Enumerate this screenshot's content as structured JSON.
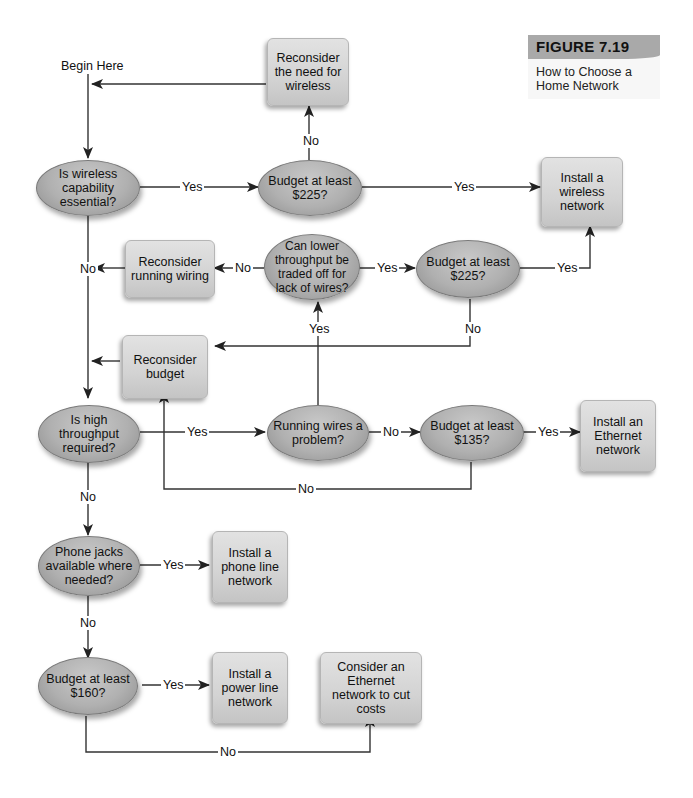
{
  "figure": {
    "label": "FIGURE 7.19",
    "caption": "How to Choose a Home Network"
  },
  "start_label": "Begin Here",
  "nodes": {
    "q_wireless": {
      "shape": "ellipse",
      "text": "Is wireless capability essential?"
    },
    "q_budget225_a": {
      "shape": "ellipse",
      "text": "Budget at least $225?"
    },
    "r_need_wireless": {
      "shape": "box",
      "text": "Reconsider the need for wireless"
    },
    "install_wireless": {
      "shape": "box",
      "text": "Install a wireless network"
    },
    "r_running_wiring": {
      "shape": "box",
      "text": "Reconsider running wiring"
    },
    "q_tradeoff": {
      "shape": "ellipse",
      "text": "Can lower throughput be traded off for lack of wires?"
    },
    "q_budget225_b": {
      "shape": "ellipse",
      "text": "Budget at least $225?"
    },
    "r_budget": {
      "shape": "box",
      "text": "Reconsider budget"
    },
    "q_throughput": {
      "shape": "ellipse",
      "text": "Is high throughput required?"
    },
    "q_wires_problem": {
      "shape": "ellipse",
      "text": "Running wires a problem?"
    },
    "q_budget135": {
      "shape": "ellipse",
      "text": "Budget at least $135?"
    },
    "install_ethernet": {
      "shape": "box",
      "text": "Install an Ethernet network"
    },
    "q_phone_jacks": {
      "shape": "ellipse",
      "text": "Phone jacks available where needed?"
    },
    "install_phone": {
      "shape": "box",
      "text": "Install a phone line network"
    },
    "q_budget160": {
      "shape": "ellipse",
      "text": "Budget at least $160?"
    },
    "install_power": {
      "shape": "box",
      "text": "Install a power line network"
    },
    "consider_ethernet": {
      "shape": "box",
      "text": "Consider an Ethernet network to cut costs"
    }
  },
  "edges": [
    {
      "from": "start",
      "to": "q_wireless",
      "label": ""
    },
    {
      "from": "q_wireless",
      "to": "q_budget225_a",
      "label": "Yes"
    },
    {
      "from": "q_budget225_a",
      "to": "r_need_wireless",
      "label": "No"
    },
    {
      "from": "r_need_wireless",
      "to": "start",
      "label": ""
    },
    {
      "from": "q_budget225_a",
      "to": "install_wireless",
      "label": "Yes"
    },
    {
      "from": "q_wireless",
      "to": "q_throughput",
      "label": "No"
    },
    {
      "from": "q_tradeoff",
      "to": "r_running_wiring",
      "label": "No"
    },
    {
      "from": "r_running_wiring",
      "to": "q_wireless_no_path",
      "label": ""
    },
    {
      "from": "q_tradeoff",
      "to": "q_budget225_b",
      "label": "Yes"
    },
    {
      "from": "q_budget225_b",
      "to": "install_wireless",
      "label": "Yes"
    },
    {
      "from": "q_budget225_b",
      "to": "r_budget",
      "label": "No"
    },
    {
      "from": "r_budget",
      "to": "q_wireless_no_path",
      "label": ""
    },
    {
      "from": "q_throughput",
      "to": "q_wires_problem",
      "label": "Yes"
    },
    {
      "from": "q_wires_problem",
      "to": "q_tradeoff",
      "label": "Yes"
    },
    {
      "from": "q_wires_problem",
      "to": "q_budget135",
      "label": "No"
    },
    {
      "from": "q_budget135",
      "to": "install_ethernet",
      "label": "Yes"
    },
    {
      "from": "q_budget135",
      "to": "r_budget",
      "label": "No"
    },
    {
      "from": "q_throughput",
      "to": "q_phone_jacks",
      "label": "No"
    },
    {
      "from": "q_phone_jacks",
      "to": "install_phone",
      "label": "Yes"
    },
    {
      "from": "q_phone_jacks",
      "to": "q_budget160",
      "label": "No"
    },
    {
      "from": "q_budget160",
      "to": "install_power",
      "label": "Yes"
    },
    {
      "from": "q_budget160",
      "to": "consider_ethernet",
      "label": "No"
    }
  ],
  "labels": {
    "yes": "Yes",
    "no": "No"
  }
}
